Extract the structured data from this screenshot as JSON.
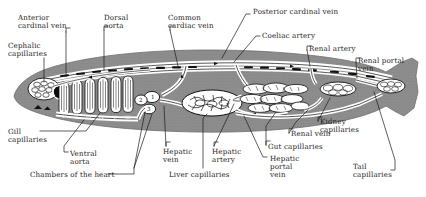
{
  "figure": {
    "body_fill": "#8c8c8c",
    "vessel_fill": "#ffffff",
    "outline": "#111111",
    "background": "#ffffff"
  },
  "labels": [
    {
      "id": "anterior-cardinal-vein",
      "text": "Anterior\ncardinal vein",
      "x": 18,
      "y": 14,
      "align": "left"
    },
    {
      "id": "cephalic-capillaries",
      "text": "Cephalic\ncapillaries",
      "x": 8,
      "y": 42,
      "align": "left"
    },
    {
      "id": "dorsal-aorta",
      "text": "Dorsal\naorta",
      "x": 104,
      "y": 14,
      "align": "left"
    },
    {
      "id": "common-cardiac-vein",
      "text": "Common\ncardiac vein",
      "x": 168,
      "y": 14,
      "align": "left"
    },
    {
      "id": "posterior-cardinal-vein",
      "text": "Posterior cardinal vein",
      "x": 253,
      "y": 8,
      "align": "left"
    },
    {
      "id": "coeliac-artery",
      "text": "Coeliac artery",
      "x": 262,
      "y": 32,
      "align": "left"
    },
    {
      "id": "renal-artery",
      "text": "Renal artery",
      "x": 309,
      "y": 45,
      "align": "left"
    },
    {
      "id": "renal-portal-vein",
      "text": "Renal portal\nvein",
      "x": 358,
      "y": 57,
      "align": "left"
    },
    {
      "id": "gill-capillaries",
      "text": "Gill\ncapillaries",
      "x": 8,
      "y": 128,
      "align": "left"
    },
    {
      "id": "ventral-aorta",
      "text": "Ventral\naorta",
      "x": 70,
      "y": 150,
      "align": "left"
    },
    {
      "id": "chambers-of-the-heart",
      "text": "Chambers of the heart",
      "x": 30,
      "y": 171,
      "align": "left"
    },
    {
      "id": "hepatic-vein",
      "text": "Hepatic\nvein",
      "x": 163,
      "y": 148,
      "align": "left"
    },
    {
      "id": "liver-capillaries",
      "text": "Liver capillaries",
      "x": 169,
      "y": 171,
      "align": "left"
    },
    {
      "id": "hepatic-artery",
      "text": "Hepatic\nartery",
      "x": 212,
      "y": 148,
      "align": "left"
    },
    {
      "id": "hepatic-portal-vein",
      "text": "Hepatic\nportal\nvein",
      "x": 270,
      "y": 155,
      "align": "left"
    },
    {
      "id": "gut-capillaries",
      "text": "Gut capillaries",
      "x": 268,
      "y": 143,
      "align": "left"
    },
    {
      "id": "renal-vein",
      "text": "Renal vein",
      "x": 291,
      "y": 130,
      "align": "left"
    },
    {
      "id": "kidney-capillaries",
      "text": "Kidney\ncapillaries",
      "x": 320,
      "y": 118,
      "align": "left"
    },
    {
      "id": "tail-capillaries",
      "text": "Tail\ncapillaries",
      "x": 353,
      "y": 163,
      "align": "left"
    }
  ],
  "heart_chambers": [
    {
      "id": "chamber-1",
      "number": "1",
      "x": 151,
      "y": 95
    },
    {
      "id": "chamber-2",
      "number": "2",
      "x": 140,
      "y": 98
    },
    {
      "id": "chamber-3",
      "number": "3",
      "x": 148,
      "y": 107
    }
  ],
  "gill_arches": [
    {
      "id": "gill-arch-1",
      "numeral": "I",
      "x": 62,
      "y": 115
    },
    {
      "id": "gill-arch-2",
      "numeral": "II",
      "x": 75,
      "y": 116
    },
    {
      "id": "gill-arch-3",
      "numeral": "III",
      "x": 88,
      "y": 116
    },
    {
      "id": "gill-arch-4",
      "numeral": "IV",
      "x": 101,
      "y": 116
    },
    {
      "id": "gill-arch-5",
      "numeral": "V",
      "x": 114,
      "y": 116
    },
    {
      "id": "gill-arch-6",
      "numeral": "VI",
      "x": 126,
      "y": 116
    }
  ]
}
